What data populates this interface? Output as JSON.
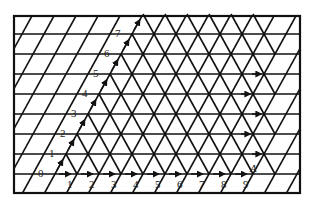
{
  "figure": {
    "colors": {
      "line": "#111111",
      "background": "#ffffff",
      "label": "#222222"
    },
    "left_labels": [
      "0",
      "1",
      "2",
      "3",
      "4",
      "5",
      "6",
      "7"
    ],
    "bottom_labels": [
      "1",
      "2",
      "3",
      "4",
      "5",
      "6",
      "7",
      "8",
      "9"
    ],
    "point_label": "A"
  }
}
